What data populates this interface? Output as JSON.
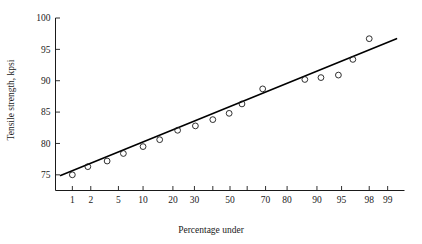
{
  "chart_data": {
    "type": "scatter",
    "title": "",
    "subtitle": "",
    "xlabel": "Percentage under",
    "ylabel": "Tensile strength, kpsi",
    "x_scale": "normal-probability",
    "grid": false,
    "legend": null,
    "xlim": [
      0.5,
      99.5
    ],
    "ylim": [
      72.5,
      100
    ],
    "xticks": [
      1,
      2,
      5,
      10,
      20,
      30,
      50,
      70,
      80,
      90,
      95,
      98,
      99
    ],
    "xtick_labels": [
      "1",
      "2",
      "5",
      "10",
      "20",
      "30",
      "50",
      "70",
      "80",
      "90",
      "95",
      "98",
      "99"
    ],
    "minor_xticks": [
      40,
      60
    ],
    "yticks": [
      75,
      80,
      85,
      90,
      95,
      100
    ],
    "ytick_labels": [
      "75",
      "80",
      "85",
      "90",
      "95",
      "100"
    ],
    "marker": "open-circle",
    "points": [
      {
        "x": 1.0,
        "y": 75.0
      },
      {
        "x": 1.8,
        "y": 76.3
      },
      {
        "x": 3.5,
        "y": 77.2
      },
      {
        "x": 5.8,
        "y": 78.4
      },
      {
        "x": 10.0,
        "y": 79.5
      },
      {
        "x": 15.0,
        "y": 80.6
      },
      {
        "x": 22.0,
        "y": 82.1
      },
      {
        "x": 30.5,
        "y": 82.8
      },
      {
        "x": 40.0,
        "y": 83.8
      },
      {
        "x": 49.5,
        "y": 84.8
      },
      {
        "x": 57.0,
        "y": 86.3
      },
      {
        "x": 68.5,
        "y": 88.7
      },
      {
        "x": 86.5,
        "y": 90.2
      },
      {
        "x": 91.0,
        "y": 90.5
      },
      {
        "x": 94.5,
        "y": 90.9
      },
      {
        "x": 96.5,
        "y": 93.4
      },
      {
        "x": 98.0,
        "y": 96.7
      }
    ],
    "fit_line": {
      "name": "fitted straight line",
      "endpoints": [
        {
          "x": 0.62,
          "y": 74.9
        },
        {
          "x": 99.3,
          "y": 96.7
        }
      ]
    }
  },
  "figure": {
    "axis_color": "#1a1a1a",
    "line_color": "#000000",
    "marker_color": "#1a1a1a",
    "background": "#ffffff"
  }
}
